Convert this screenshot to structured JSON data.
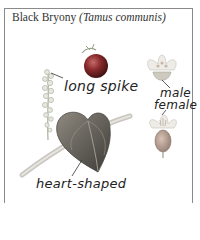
{
  "title": {
    "common_name": "Black Bryony",
    "latin_name": "(Tamus communis)"
  },
  "labels": {
    "spike": "long spike",
    "male": "male",
    "female": "female",
    "leaf": "heart-shaped"
  },
  "colors": {
    "border": "#8a8a8a",
    "berry": "#7a1f22",
    "leaf": "#6f6a63",
    "stem": "#bcbab4",
    "flower": "#d8d4c8",
    "text": "#222222"
  }
}
